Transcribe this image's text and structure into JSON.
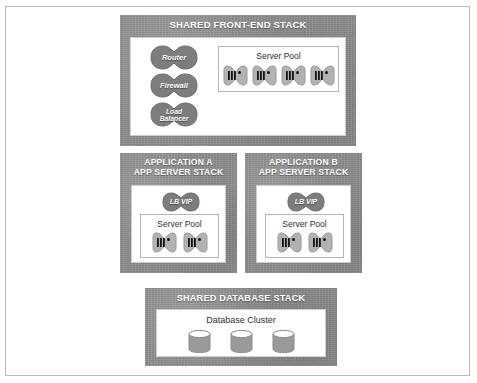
{
  "diagram": {
    "colors": {
      "stack_fill": "#8d8d8d",
      "blob_fill": "#7f7f7f",
      "server_fill": "#b0b0b0",
      "server_bar": "#141414",
      "cylinder_fill": "#9a9a9a",
      "panel_border": "#cfcfcf",
      "frame_border": "#b9b9b9",
      "title_text": "#ffffff",
      "body_text": "#2e2e2e"
    },
    "stacks": [
      {
        "id": "front-end",
        "title": "SHARED FRONT-END STACK",
        "devices": [
          {
            "id": "router",
            "label": "Router"
          },
          {
            "id": "firewall",
            "label": "Firewall"
          },
          {
            "id": "load-balancer",
            "label": "Load\nBalancer"
          }
        ],
        "pool": {
          "label": "Server Pool",
          "server_count": 4
        }
      },
      {
        "id": "application-a",
        "title": "APPLICATION A\nAPP SERVER STACK",
        "devices": [
          {
            "id": "lb-vip",
            "label": "LB VIP"
          }
        ],
        "pool": {
          "label": "Server Pool",
          "server_count": 2
        }
      },
      {
        "id": "application-b",
        "title": "APPLICATION B\nAPP SERVER STACK",
        "devices": [
          {
            "id": "lb-vip",
            "label": "LB VIP"
          }
        ],
        "pool": {
          "label": "Server Pool",
          "server_count": 2
        }
      },
      {
        "id": "database",
        "title": "SHARED DATABASE STACK",
        "cluster": {
          "label": "Database Cluster",
          "node_count": 3
        }
      }
    ]
  }
}
